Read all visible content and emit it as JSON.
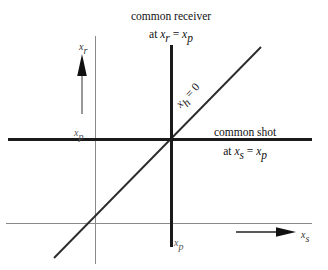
{
  "figure": {
    "title": "",
    "background_color": "#ffffff",
    "line_color": "#1a1a1a",
    "grid_color": "#8a8a8a"
  },
  "annotations": {
    "receiver": {
      "line1": "common receiver",
      "line2_prefix": "at ",
      "line2_var1": "x",
      "line2_sub1": "r",
      "line2_eq": " = ",
      "line2_var2": "x",
      "line2_sub2": "p"
    },
    "shot": {
      "line1": "common shot",
      "line2_prefix": "at ",
      "line2_var1": "x",
      "line2_sub1": "s",
      "line2_eq": " = ",
      "line2_var2": "x",
      "line2_sub2": "p"
    },
    "diagonal": {
      "var": "x",
      "sub": "h",
      "eq": " = 0"
    },
    "left_tick": {
      "var": "x",
      "sub": "p"
    },
    "bottom_tick": {
      "var": "x",
      "sub": "p"
    },
    "vertical_axis": {
      "var": "x",
      "sub": "r"
    },
    "horizontal_axis": {
      "var": "x",
      "sub": "s"
    }
  },
  "geometry": {
    "bold_horizontal_y": 139,
    "bold_vertical_x": 171,
    "thin_horizontal_y": 223,
    "thin_vertical_x": 95,
    "diagonal_start": [
      54,
      258
    ],
    "diagonal_end": [
      261,
      47
    ],
    "intersection": [
      171,
      139
    ]
  },
  "icons": {
    "up_arrow": "arrow-up-icon",
    "right_arrow": "arrow-right-icon"
  }
}
